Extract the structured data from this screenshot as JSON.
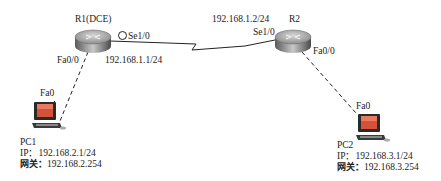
{
  "routers": {
    "r1": {
      "name": "R1(DCE)",
      "serial_port": "Se1/0",
      "serial_ip": "192.168.1.1/24",
      "fa_port": "Fa0/0",
      "clock_icon": "clock-icon"
    },
    "r2": {
      "name": "R2",
      "serial_port": "Se1/0",
      "serial_ip": "192.168.1.2/24",
      "fa_port": "Fa0/0"
    }
  },
  "pcs": {
    "pc1": {
      "name": "PC1",
      "port": "Fa0",
      "ip_label": "IP：",
      "ip": "192.168.2.1/24",
      "gw_label": "网关：",
      "gw": "192.168.2.254"
    },
    "pc2": {
      "name": "PC2",
      "port": "Fa0",
      "ip_label": "IP：",
      "ip": "192.168.3.1/24",
      "gw_label": "网关：",
      "gw": "192.168.3.254"
    }
  },
  "links": [
    {
      "type": "serial",
      "from": "R1 Se1/0",
      "to": "R2 Se1/0"
    },
    {
      "type": "ethernet-dashed",
      "from": "R1 Fa0/0",
      "to": "PC1 Fa0"
    },
    {
      "type": "ethernet-dashed",
      "from": "R2 Fa0/0",
      "to": "PC2 Fa0"
    }
  ]
}
